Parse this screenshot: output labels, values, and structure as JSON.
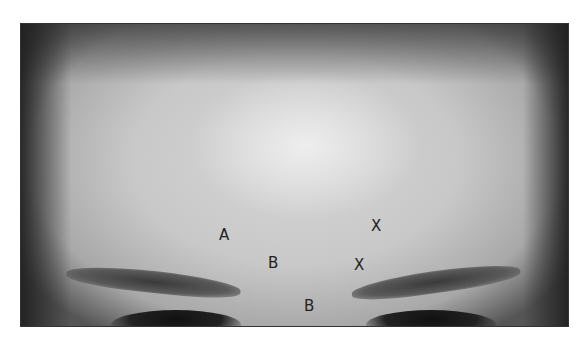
{
  "image": {
    "description": "Grayscale photograph of a forehead with eyebrows, annotated with letter markers",
    "labels": [
      {
        "text": "A",
        "x": 219,
        "y": 228
      },
      {
        "text": "B",
        "x": 268,
        "y": 256
      },
      {
        "text": "B",
        "x": 304,
        "y": 299
      },
      {
        "text": "X",
        "x": 371,
        "y": 219
      },
      {
        "text": "X",
        "x": 354,
        "y": 258
      }
    ]
  }
}
